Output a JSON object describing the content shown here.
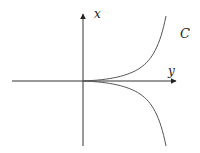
{
  "diagram": {
    "type": "cusp curve on axes",
    "axes": {
      "vertical_label": "x",
      "horizontal_label": "y"
    },
    "curve_label": "C",
    "colors": {
      "axis": "#333333",
      "curve": "#555555",
      "text": "#222222",
      "background": "#ffffff"
    }
  }
}
